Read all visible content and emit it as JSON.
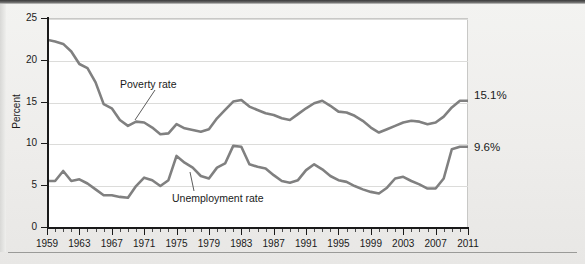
{
  "figure": {
    "background_color": "#eeeeec",
    "plot_background_color": "#ffffff",
    "line_color": "#808080",
    "grid_color": "#dcdcda",
    "axis_color": "#1a1a1a"
  },
  "axes": {
    "y_title": "Percent",
    "y_ticks": [
      "0",
      "5",
      "10",
      "15",
      "20",
      "25"
    ],
    "x_ticks": [
      "1959",
      "1963",
      "1967",
      "1971",
      "1975",
      "1979",
      "1983",
      "1987",
      "1991",
      "1995",
      "1999",
      "2003",
      "2007",
      "2011"
    ]
  },
  "annotations": {
    "poverty_label": "Poverty rate",
    "unemployment_label": "Unemployment  rate",
    "poverty_end_value": "15.1%",
    "unemployment_end_value": "9.6%"
  },
  "chart_data": {
    "type": "line",
    "title": "",
    "subtitle": "",
    "xlabel": "",
    "ylabel": "Percent",
    "xlim": [
      1959,
      2011
    ],
    "ylim": [
      0,
      25
    ],
    "y_tick_values": [
      0,
      5,
      10,
      15,
      20,
      25
    ],
    "x_tick_values": [
      1959,
      1963,
      1967,
      1971,
      1975,
      1979,
      1983,
      1987,
      1991,
      1995,
      1999,
      2003,
      2007,
      2011
    ],
    "x_minor_tick_interval": 1,
    "grid": "horizontal",
    "legend": "inline-annotations",
    "x": [
      1959,
      1960,
      1961,
      1962,
      1963,
      1964,
      1965,
      1966,
      1967,
      1968,
      1969,
      1970,
      1971,
      1972,
      1973,
      1974,
      1975,
      1976,
      1977,
      1978,
      1979,
      1980,
      1981,
      1982,
      1983,
      1984,
      1985,
      1986,
      1987,
      1988,
      1989,
      1990,
      1991,
      1992,
      1993,
      1994,
      1995,
      1996,
      1997,
      1998,
      1999,
      2000,
      2001,
      2002,
      2003,
      2004,
      2005,
      2006,
      2007,
      2008,
      2009,
      2010,
      2011
    ],
    "series": [
      {
        "name": "Poverty rate",
        "color": "#808080",
        "end_label": "15.1%",
        "values": [
          22.4,
          22.2,
          21.9,
          21.0,
          19.5,
          19.0,
          17.3,
          14.7,
          14.2,
          12.8,
          12.1,
          12.6,
          12.5,
          11.9,
          11.1,
          11.2,
          12.3,
          11.8,
          11.6,
          11.4,
          11.7,
          13.0,
          14.0,
          15.0,
          15.2,
          14.4,
          14.0,
          13.6,
          13.4,
          13.0,
          12.8,
          13.5,
          14.2,
          14.8,
          15.1,
          14.5,
          13.8,
          13.7,
          13.3,
          12.7,
          11.9,
          11.3,
          11.7,
          12.1,
          12.5,
          12.7,
          12.6,
          12.3,
          12.5,
          13.2,
          14.3,
          15.1,
          15.1
        ]
      },
      {
        "name": "Unemployment rate",
        "color": "#808080",
        "end_label": "9.6%",
        "values": [
          5.5,
          5.5,
          6.7,
          5.5,
          5.7,
          5.2,
          4.5,
          3.8,
          3.8,
          3.6,
          3.5,
          4.9,
          5.9,
          5.6,
          4.9,
          5.6,
          8.5,
          7.7,
          7.1,
          6.1,
          5.8,
          7.1,
          7.6,
          9.7,
          9.6,
          7.5,
          7.2,
          7.0,
          6.2,
          5.5,
          5.3,
          5.6,
          6.8,
          7.5,
          6.9,
          6.1,
          5.6,
          5.4,
          4.9,
          4.5,
          4.2,
          4.0,
          4.7,
          5.8,
          6.0,
          5.5,
          5.1,
          4.6,
          4.6,
          5.8,
          9.3,
          9.6,
          9.6
        ]
      }
    ]
  }
}
